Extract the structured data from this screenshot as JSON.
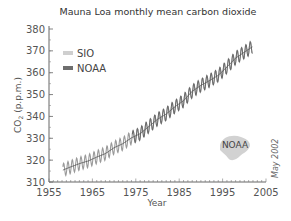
{
  "chart_data": {
    "type": "line",
    "title": "Mauna Loa monthly mean carbon dioxide",
    "xlabel": "Year",
    "ylabel": "CO2 (p.p.m.)",
    "xlim": [
      1955,
      2005
    ],
    "ylim": [
      310,
      380
    ],
    "x_ticks": [
      1955,
      1965,
      1975,
      1985,
      1995,
      2005
    ],
    "y_ticks": [
      310,
      320,
      330,
      340,
      350,
      360,
      370,
      380
    ],
    "grid": false,
    "legend_position": "upper-left",
    "annotations": [
      "NOAA",
      "May 2002"
    ],
    "series": [
      {
        "name": "SIO",
        "color": "#c8c8c8",
        "x": [
          1958,
          1960,
          1962,
          1964,
          1966,
          1968,
          1970,
          1972,
          1974,
          1976,
          1978,
          1980,
          1982,
          1984,
          1986,
          1988,
          1990,
          1992,
          1994,
          1996,
          1998,
          2000,
          2002
        ],
        "values": [
          315.3,
          316.9,
          318.4,
          319.6,
          321.4,
          323.0,
          325.7,
          327.5,
          330.2,
          332.1,
          335.4,
          338.7,
          341.1,
          344.4,
          347.2,
          351.5,
          354.2,
          356.4,
          358.8,
          362.6,
          366.7,
          369.4,
          372.0
        ]
      },
      {
        "name": "NOAA",
        "color": "#6e6e6e",
        "x": [
          1974,
          1976,
          1978,
          1980,
          1982,
          1984,
          1986,
          1988,
          1990,
          1992,
          1994,
          1996,
          1998,
          2000,
          2002
        ],
        "values": [
          330.2,
          332.1,
          335.4,
          338.7,
          341.1,
          344.4,
          347.2,
          351.5,
          354.2,
          356.4,
          358.8,
          362.6,
          366.7,
          369.4,
          372.0
        ]
      }
    ],
    "seasonal_amplitude_ppm": 6
  },
  "labels": {
    "title": "Mauna Loa monthly mean carbon dioxide",
    "ylabel_main": "CO",
    "ylabel_sub": "2",
    "ylabel_unit": " (p.p.m.)",
    "xlabel": "Year",
    "legend_sio": "SIO",
    "legend_noaa": "NOAA",
    "logo": "NOAA",
    "date_note": "May 2002"
  }
}
